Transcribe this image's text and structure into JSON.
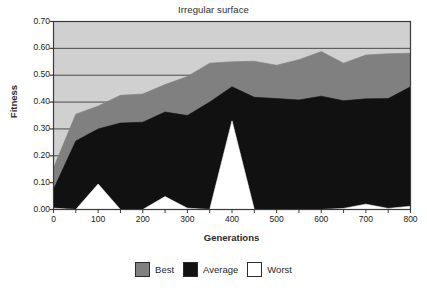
{
  "chart_data": {
    "type": "area",
    "title": "Irregular surface",
    "xlabel": "Generations",
    "ylabel": "Fitness",
    "xlim": [
      0,
      800
    ],
    "ylim": [
      0.0,
      0.7
    ],
    "grid": true,
    "legend_position": "bottom",
    "x": [
      0,
      50,
      100,
      150,
      200,
      250,
      300,
      350,
      400,
      450,
      500,
      550,
      600,
      650,
      700,
      750,
      800
    ],
    "xticks": [
      "0",
      "100",
      "200",
      "300",
      "400",
      "500",
      "600",
      "700",
      "800"
    ],
    "xtick_values": [
      0,
      100,
      200,
      300,
      400,
      500,
      600,
      700,
      800
    ],
    "yticks": [
      "0.00",
      "0.10",
      "0.20",
      "0.30",
      "0.40",
      "0.50",
      "0.60",
      "0.70"
    ],
    "ytick_values": [
      0.0,
      0.1,
      0.2,
      0.3,
      0.4,
      0.5,
      0.6,
      0.7
    ],
    "series": [
      {
        "name": "Best",
        "color": "#808080",
        "values": [
          0.155,
          0.355,
          0.385,
          0.425,
          0.43,
          0.465,
          0.495,
          0.545,
          0.55,
          0.552,
          0.537,
          0.558,
          0.588,
          0.545,
          0.575,
          0.58,
          0.582
        ]
      },
      {
        "name": "Average",
        "color": "#111111",
        "values": [
          0.075,
          0.255,
          0.3,
          0.322,
          0.325,
          0.363,
          0.35,
          0.4,
          0.457,
          0.418,
          0.413,
          0.408,
          0.422,
          0.405,
          0.412,
          0.413,
          0.457
        ]
      },
      {
        "name": "Worst",
        "color": "#ffffff",
        "values": [
          0.005,
          0.0,
          0.095,
          0.0,
          0.0,
          0.048,
          0.005,
          0.0,
          0.33,
          0.0,
          0.0,
          0.0,
          0.0,
          0.004,
          0.02,
          0.004,
          0.012
        ]
      }
    ],
    "plot_bg": "#d0d0d0",
    "frame_color": "#3a3a3a",
    "gridline_color": "#4a4a4a"
  },
  "legend": {
    "items": [
      {
        "label": "Best",
        "color": "#808080"
      },
      {
        "label": "Average",
        "color": "#111111"
      },
      {
        "label": "Worst",
        "color": "#ffffff"
      }
    ]
  }
}
